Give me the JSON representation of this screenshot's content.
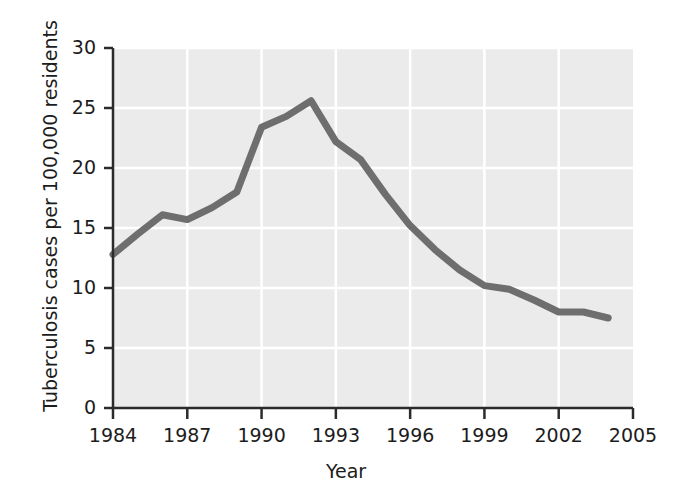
{
  "chart_data": {
    "type": "line",
    "title": "",
    "xlabel": "Year",
    "ylabel": "Tuberculosis cases per 100,000 residents",
    "xlim": [
      1984,
      2005
    ],
    "ylim": [
      0,
      30
    ],
    "grid": true,
    "legend": null,
    "x_ticks": [
      "1984",
      "1987",
      "1990",
      "1993",
      "1996",
      "1999",
      "2002",
      "2005"
    ],
    "x_tick_values": [
      1984,
      1987,
      1990,
      1993,
      1996,
      1999,
      2002,
      2005
    ],
    "y_ticks": [
      "0",
      "5",
      "10",
      "15",
      "20",
      "25",
      "30"
    ],
    "y_tick_values": [
      0,
      5,
      10,
      15,
      20,
      25,
      30
    ],
    "x": [
      1984,
      1985,
      1986,
      1987,
      1988,
      1989,
      1990,
      1991,
      1992,
      1993,
      1994,
      1995,
      1996,
      1997,
      1998,
      1999,
      2000,
      2001,
      2002,
      2003,
      2004
    ],
    "values": [
      12.8,
      14.5,
      16.1,
      15.7,
      16.7,
      18.0,
      23.4,
      24.3,
      25.6,
      22.2,
      20.7,
      17.8,
      15.2,
      13.2,
      11.5,
      10.2,
      9.9,
      9.0,
      8.0,
      8.0,
      7.5
    ],
    "series": [
      {
        "name": "Tuberculosis case rate",
        "values": [
          12.8,
          14.5,
          16.1,
          15.7,
          16.7,
          18.0,
          23.4,
          24.3,
          25.6,
          22.2,
          20.7,
          17.8,
          15.2,
          13.2,
          11.5,
          10.2,
          9.9,
          9.0,
          8.0,
          8.0,
          7.5
        ]
      }
    ],
    "colors": {
      "line": "#6e6e6e",
      "plot_background": "#ebebeb",
      "gridline": "#ffffff",
      "axis": "#2b2b2b",
      "text": "#1c1c1c"
    }
  }
}
